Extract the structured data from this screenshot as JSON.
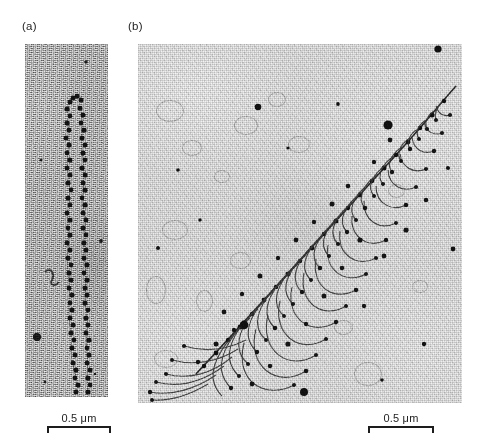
{
  "figure": {
    "type": "electron-micrograph-figure",
    "background_color": "#ffffff",
    "ink_color": "#1d1d1d"
  },
  "panels": [
    {
      "id": "a",
      "label": "(a)",
      "subject": "beads-on-a-string chromatin fiber (nucleosomes on DNA)",
      "frame": {
        "x": 25,
        "y": 44,
        "width": 83,
        "height": 353
      },
      "background_tone": "#d9d9d9",
      "grain": "coarse",
      "scalebar": {
        "text": "0.5 μm",
        "value": 0.5,
        "unit": "μm",
        "bar_length_px": 64
      }
    },
    {
      "id": "b",
      "label": "(b)",
      "subject": "rRNA transcription unit, Miller spread ‘Christmas tree’",
      "frame": {
        "x": 138,
        "y": 44,
        "width": 324,
        "height": 359
      },
      "background_tone": "#e8e8e8",
      "grain": "fine",
      "scalebar": {
        "text": "0.5 μm",
        "value": 0.5,
        "unit": "μm",
        "bar_length_px": 66
      }
    }
  ],
  "labels": {
    "panel_a": "(a)",
    "panel_b": "(b)"
  },
  "scalebars": {
    "panel_a_text": "0.5 μm",
    "panel_b_text": "0.5 μm"
  }
}
